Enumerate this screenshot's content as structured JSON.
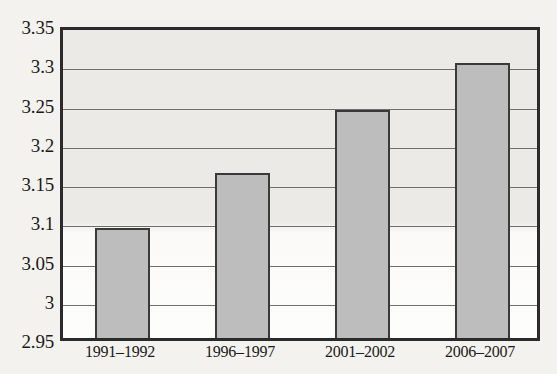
{
  "chart_data": {
    "type": "bar",
    "title": "",
    "subtitle": "",
    "xlabel": "",
    "ylabel": "",
    "categories": [
      "1991–1992",
      "1996–1997",
      "2001–2002",
      "2006–2007"
    ],
    "values": [
      3.09,
      3.16,
      3.24,
      3.3
    ],
    "series": [
      {
        "name": "",
        "values": [
          3.09,
          3.16,
          3.24,
          3.3
        ]
      }
    ],
    "ylim": [
      2.95,
      3.35
    ],
    "y_tick_labels": [
      "3.35",
      "3.3",
      "3.25",
      "3.2",
      "3.15",
      "3.1",
      "3.05",
      "3",
      "2.95"
    ],
    "y_tick_values": [
      3.35,
      3.3,
      3.25,
      3.2,
      3.15,
      3.1,
      3.05,
      3.0,
      2.95
    ],
    "y_tick_step": 0.05,
    "grid": true,
    "grid_axis": "y",
    "legend": false,
    "legend_position": "none",
    "annotations": [],
    "colors": {
      "bar_fill": "#bdbdbd",
      "bar_border": "#3a3a3a",
      "gridline": "#6e6e6e",
      "axis_border": "#2b2b2b",
      "plot_background": "#eceae6",
      "page_background": "#f4f2ee",
      "text": "#1a1a1a"
    }
  }
}
